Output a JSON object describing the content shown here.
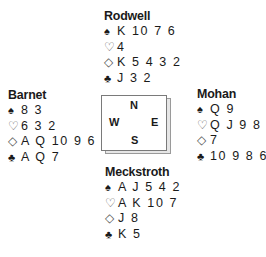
{
  "compass": {
    "north": "N",
    "south": "S",
    "east": "E",
    "west": "W"
  },
  "suit_symbols": {
    "spades": "♠",
    "hearts": "♡",
    "diamonds": "◇",
    "clubs": "♣"
  },
  "hands": {
    "north": {
      "player": "Rodwell",
      "spades": "K 10 7 6",
      "hearts": "4",
      "diamonds": "K 5 4 3 2",
      "clubs": "J 3 2"
    },
    "west": {
      "player": "Barnet",
      "spades": "8 3",
      "hearts": "6 3 2",
      "diamonds": "A Q 10 9 6",
      "clubs": "A Q 7"
    },
    "east": {
      "player": "Mohan",
      "spades": "Q 9",
      "hearts": "Q J 9 8 5",
      "diamonds": "7",
      "clubs": "10 9 8 6 4"
    },
    "south": {
      "player": "Meckstroth",
      "spades": "A J 5 4 2",
      "hearts": "A K 10 7",
      "diamonds": "J 8",
      "clubs": "K 5"
    }
  }
}
